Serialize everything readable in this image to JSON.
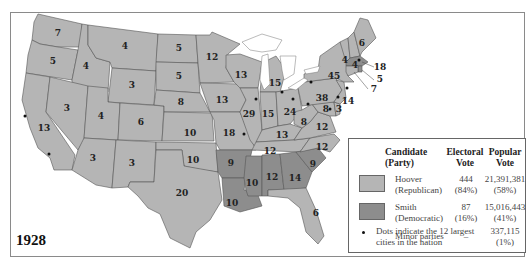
{
  "map": {
    "year": "1928",
    "colors": {
      "republican": "#b5b5b5",
      "democratic": "#8d8d8d",
      "border": "#555555"
    },
    "states": [
      {
        "name": "Washington",
        "ev": "7",
        "party": "R"
      },
      {
        "name": "Oregon",
        "ev": "5",
        "party": "R"
      },
      {
        "name": "California",
        "ev": "13",
        "party": "R"
      },
      {
        "name": "Idaho",
        "ev": "4",
        "party": "R"
      },
      {
        "name": "Nevada",
        "ev": "3",
        "party": "R"
      },
      {
        "name": "Montana",
        "ev": "4",
        "party": "R"
      },
      {
        "name": "Wyoming",
        "ev": "3",
        "party": "R"
      },
      {
        "name": "Utah",
        "ev": "4",
        "party": "R"
      },
      {
        "name": "Colorado",
        "ev": "6",
        "party": "R"
      },
      {
        "name": "Arizona",
        "ev": "3",
        "party": "R"
      },
      {
        "name": "New Mexico",
        "ev": "3",
        "party": "R"
      },
      {
        "name": "North Dakota",
        "ev": "5",
        "party": "R"
      },
      {
        "name": "South Dakota",
        "ev": "5",
        "party": "R"
      },
      {
        "name": "Nebraska",
        "ev": "8",
        "party": "R"
      },
      {
        "name": "Kansas",
        "ev": "10",
        "party": "R"
      },
      {
        "name": "Oklahoma",
        "ev": "10",
        "party": "R"
      },
      {
        "name": "Texas",
        "ev": "20",
        "party": "R"
      },
      {
        "name": "Minnesota",
        "ev": "12",
        "party": "R"
      },
      {
        "name": "Iowa",
        "ev": "13",
        "party": "R"
      },
      {
        "name": "Missouri",
        "ev": "18",
        "party": "R"
      },
      {
        "name": "Arkansas",
        "ev": "9",
        "party": "D"
      },
      {
        "name": "Louisiana",
        "ev": "10",
        "party": "D"
      },
      {
        "name": "Wisconsin",
        "ev": "13",
        "party": "R"
      },
      {
        "name": "Illinois",
        "ev": "29",
        "party": "R"
      },
      {
        "name": "Michigan",
        "ev": "15",
        "party": "R"
      },
      {
        "name": "Indiana",
        "ev": "15",
        "party": "R"
      },
      {
        "name": "Ohio",
        "ev": "24",
        "party": "R"
      },
      {
        "name": "Kentucky",
        "ev": "13",
        "party": "R"
      },
      {
        "name": "Tennessee",
        "ev": "12",
        "party": "R"
      },
      {
        "name": "Mississippi",
        "ev": "10",
        "party": "D"
      },
      {
        "name": "Alabama",
        "ev": "12",
        "party": "D"
      },
      {
        "name": "Georgia",
        "ev": "14",
        "party": "D"
      },
      {
        "name": "South Carolina",
        "ev": "9",
        "party": "D"
      },
      {
        "name": "Florida",
        "ev": "6",
        "party": "R"
      },
      {
        "name": "North Carolina",
        "ev": "12",
        "party": "R"
      },
      {
        "name": "Virginia",
        "ev": "12",
        "party": "R"
      },
      {
        "name": "West Virginia",
        "ev": "8",
        "party": "R"
      },
      {
        "name": "Maryland",
        "ev": "8",
        "party": "R"
      },
      {
        "name": "Delaware",
        "ev": "3",
        "party": "R"
      },
      {
        "name": "Pennsylvania",
        "ev": "38",
        "party": "R"
      },
      {
        "name": "New Jersey",
        "ev": "14",
        "party": "R"
      },
      {
        "name": "New York",
        "ev": "45",
        "party": "R"
      },
      {
        "name": "Vermont",
        "ev": "4",
        "party": "R"
      },
      {
        "name": "New Hampshire",
        "ev": "4",
        "party": "R"
      },
      {
        "name": "Maine",
        "ev": "6",
        "party": "R"
      },
      {
        "name": "Massachusetts",
        "ev": "18",
        "party": "D"
      },
      {
        "name": "Rhode Island",
        "ev": "5",
        "party": "D"
      },
      {
        "name": "Connecticut",
        "ev": "7",
        "party": "R"
      }
    ]
  },
  "legend": {
    "headers": {
      "candidate": "Candidate",
      "candidate_sub": "(Party)",
      "electoral": "Electoral",
      "electoral_sub": "Vote",
      "popular": "Popular",
      "popular_sub": "Vote"
    },
    "rows": [
      {
        "name": "Hoover",
        "party": "(Republican)",
        "electoral": "444",
        "electoral_pct": "(84%)",
        "popular": "21,391,381",
        "popular_pct": "(58%)",
        "color": "#b5b5b5"
      },
      {
        "name": "Smith",
        "party": "(Democratic)",
        "electoral": "87",
        "electoral_pct": "(16%)",
        "popular": "15,016,443",
        "popular_pct": "(41%)",
        "color": "#8d8d8d"
      },
      {
        "name": "Minor parties",
        "party": "",
        "electoral": "–",
        "electoral_pct": "",
        "popular": "337,115",
        "popular_pct": "(1%)"
      }
    ],
    "dots_note_line1": "Dots indicate the 12 largest",
    "dots_note_line2": "cities in the nation"
  }
}
